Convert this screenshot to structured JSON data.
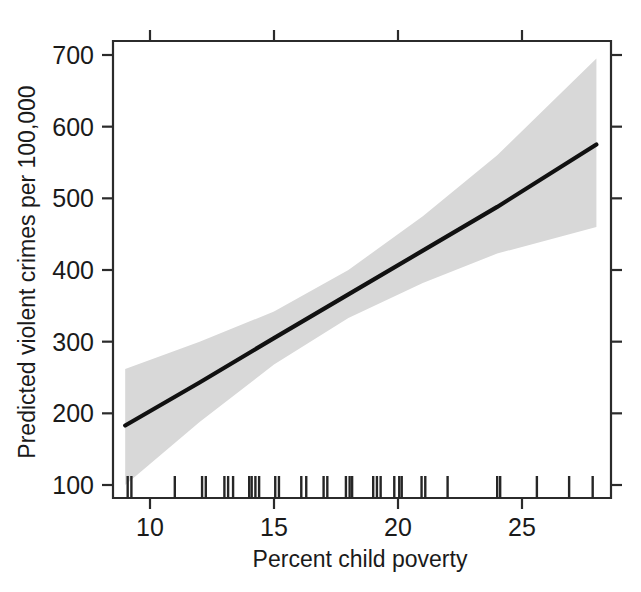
{
  "figure": {
    "background_color": "#ffffff",
    "ink_color": "#1a1a1a",
    "band_color": "#d8d8d8",
    "line_color": "#111111"
  },
  "chart_data": {
    "type": "line",
    "title": "",
    "subtitle": "",
    "xlabel": "Percent child poverty",
    "ylabel": "Predicted violent crimes per 100,000",
    "xlim": [
      9,
      28
    ],
    "ylim": [
      85,
      710
    ],
    "grid": false,
    "legend": null,
    "x_ticks": [
      10,
      15,
      20,
      25
    ],
    "x_tick_labels": [
      "10",
      "15",
      "20",
      "25"
    ],
    "y_ticks": [
      100,
      200,
      300,
      400,
      500,
      600,
      700
    ],
    "y_tick_labels": [
      "100",
      "200",
      "300",
      "400",
      "500",
      "600",
      "700"
    ],
    "series": [
      {
        "name": "Predicted violent crime rate",
        "type": "line",
        "x": [
          9,
          12,
          15,
          18,
          21,
          24,
          28
        ],
        "values": [
          183,
          243,
          305,
          366,
          427,
          488,
          575
        ]
      },
      {
        "name": "Confidence band upper",
        "type": "band_upper",
        "x": [
          9,
          12,
          15,
          18,
          21,
          24,
          28
        ],
        "values": [
          262,
          300,
          342,
          400,
          475,
          560,
          695
        ]
      },
      {
        "name": "Confidence band lower",
        "type": "band_lower",
        "x": [
          9,
          12,
          15,
          18,
          21,
          24,
          28
        ],
        "values": [
          100,
          188,
          268,
          333,
          382,
          423,
          460
        ]
      }
    ],
    "rug": {
      "name": "Observed percent child poverty values",
      "axis": "x",
      "values": [
        9.1,
        9.25,
        11.0,
        12.1,
        12.25,
        13.0,
        13.15,
        13.35,
        14.0,
        14.1,
        14.25,
        14.4,
        15.05,
        15.2,
        16.1,
        16.3,
        17.0,
        17.15,
        17.9,
        18.05,
        18.15,
        19.0,
        19.15,
        19.3,
        19.85,
        20.05,
        20.15,
        20.95,
        21.1,
        22.0,
        24.0,
        24.12,
        25.6,
        26.9,
        27.85
      ]
    },
    "annotations": []
  },
  "axes": {
    "x_axis_name": "x-axis",
    "y_axis_name": "y-axis"
  }
}
